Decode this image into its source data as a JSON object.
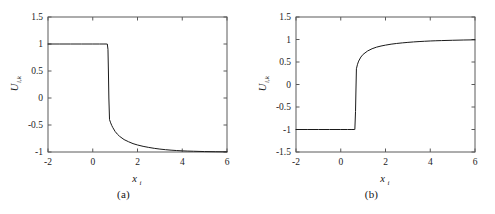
{
  "figure": {
    "panels": [
      {
        "id": "a",
        "caption": "(a)",
        "xlabel_main": "x",
        "xlabel_sub": "i",
        "ylabel_main": "U",
        "ylabel_sub": "i,k",
        "xticks": [
          "-2",
          "0",
          "2",
          "4",
          "6"
        ],
        "yticks": [
          "1.5",
          "1",
          "0.5",
          "0",
          "-0.5",
          "-1"
        ]
      },
      {
        "id": "b",
        "caption": "(b)",
        "xlabel_main": "x",
        "xlabel_sub": "i",
        "ylabel_main": "U",
        "ylabel_sub": "i,k",
        "xticks": [
          "-2",
          "0",
          "2",
          "4",
          "6"
        ],
        "yticks": [
          "1.5",
          "1",
          "0.5",
          "0",
          "-0.5",
          "-1",
          "-1.5"
        ]
      }
    ]
  },
  "chart_data": [
    {
      "type": "line",
      "title": "(a)",
      "xlabel": "x_i",
      "ylabel": "U_i,k",
      "xlim": [
        -2,
        6
      ],
      "ylim": [
        -1,
        1.5
      ],
      "xticks": [
        -2,
        0,
        2,
        4,
        6
      ],
      "yticks": [
        1.5,
        1,
        0.5,
        0,
        -0.5,
        -1
      ],
      "grid": false,
      "legend": null,
      "line_color": "#1a1a1a",
      "series": [
        {
          "name": "U_i,k",
          "x": [
            -2.0,
            -1.5,
            -1.0,
            -0.5,
            0.0,
            0.3,
            0.5,
            0.6,
            0.65,
            0.68,
            0.7,
            0.72,
            0.75,
            0.8,
            0.85,
            0.9,
            1.0,
            1.1,
            1.2,
            1.4,
            1.6,
            1.8,
            2.0,
            2.25,
            2.5,
            2.75,
            3.0,
            3.25,
            3.5,
            3.75,
            4.0,
            4.25,
            4.5,
            5.0,
            5.5,
            6.0
          ],
          "y": [
            1.0,
            1.0,
            1.0,
            1.0,
            1.0,
            1.0,
            1.0,
            1.0,
            1.0,
            0.9,
            0.5,
            0.0,
            -0.4,
            -0.46,
            -0.51,
            -0.55,
            -0.62,
            -0.67,
            -0.71,
            -0.77,
            -0.81,
            -0.845,
            -0.87,
            -0.895,
            -0.915,
            -0.932,
            -0.946,
            -0.957,
            -0.966,
            -0.973,
            -0.979,
            -0.983,
            -0.986,
            -0.992,
            -0.995,
            -0.997
          ]
        }
      ]
    },
    {
      "type": "line",
      "title": "(b)",
      "xlabel": "x_i",
      "ylabel": "U_i,k",
      "xlim": [
        -2,
        6
      ],
      "ylim": [
        -1.5,
        1.5
      ],
      "xticks": [
        -2,
        0,
        2,
        4,
        6
      ],
      "yticks": [
        1.5,
        1,
        0.5,
        0,
        -0.5,
        -1,
        -1.5
      ],
      "grid": false,
      "legend": null,
      "line_color": "#1a1a1a",
      "series": [
        {
          "name": "U_i,k",
          "x": [
            -2.0,
            -1.5,
            -1.0,
            -0.5,
            0.0,
            0.3,
            0.5,
            0.6,
            0.63,
            0.66,
            0.68,
            0.7,
            0.75,
            0.8,
            0.9,
            1.0,
            1.2,
            1.4,
            1.6,
            1.8,
            2.0,
            2.25,
            2.5,
            2.75,
            3.0,
            3.25,
            3.5,
            3.75,
            4.0,
            4.25,
            4.5,
            5.0,
            5.5,
            6.0
          ],
          "y": [
            -1.0,
            -1.0,
            -1.0,
            -1.0,
            -1.0,
            -1.0,
            -1.0,
            -1.0,
            -1.0,
            -0.6,
            -0.1,
            0.35,
            0.45,
            0.52,
            0.61,
            0.67,
            0.745,
            0.795,
            0.83,
            0.855,
            0.875,
            0.896,
            0.912,
            0.925,
            0.936,
            0.946,
            0.954,
            0.961,
            0.967,
            0.972,
            0.976,
            0.983,
            0.989,
            0.993
          ]
        }
      ]
    }
  ]
}
